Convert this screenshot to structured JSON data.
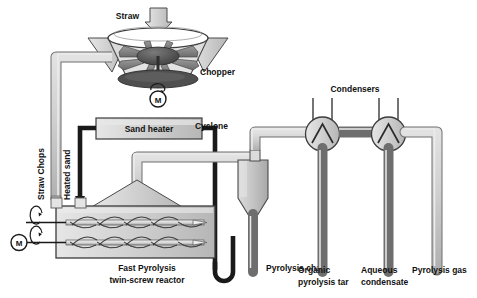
{
  "diagram": {
    "colors": {
      "pipe_fill": "#c9c9c9",
      "pipe_stroke": "#6e6e6e",
      "black_pipe": "#1a1a1a",
      "vessel_fill": "#d2d2d2",
      "vessel_stroke": "#555555",
      "blade_fill": "#8a8a8a",
      "hub_fill": "#555555",
      "background": "#ffffff",
      "text": "#111111"
    },
    "labels": {
      "straw": "Straw",
      "chopper": "Chopper",
      "motor_chopper": "M",
      "straw_chops": "Straw Chops",
      "heated_sand": "Heated sand",
      "sand_heater": "Sand heater",
      "cyclone": "Cyclone",
      "condensers": "Condensers",
      "motor_reactor": "M",
      "reactor_line1": "Fast Pyrolysis",
      "reactor_line2": "twin-screw reactor",
      "pyrolysis_char": "Pyrolysis char",
      "organic_tar_line1": "Organic",
      "organic_tar_line2": "pyrolysis tar",
      "aqueous_line1": "Aqueous",
      "aqueous_line2": "condensate",
      "pyrolysis_gas": "Pyrolysis gas"
    },
    "equipment": [
      {
        "name": "chopper",
        "label": "Chopper",
        "type": "rotary-chopper"
      },
      {
        "name": "sand-heater",
        "label": "Sand heater",
        "type": "box-heater"
      },
      {
        "name": "twin-screw-reactor",
        "label": "Fast Pyrolysis twin-screw reactor",
        "type": "twin-screw"
      },
      {
        "name": "cyclone",
        "label": "Cyclone",
        "type": "cyclone-separator"
      },
      {
        "name": "condenser-1",
        "label": "Condensers",
        "type": "heat-exchanger"
      },
      {
        "name": "condenser-2",
        "label": "Condensers",
        "type": "heat-exchanger"
      }
    ],
    "streams": [
      {
        "name": "straw-feed",
        "label": "Straw"
      },
      {
        "name": "straw-chops",
        "label": "Straw Chops"
      },
      {
        "name": "heated-sand",
        "label": "Heated sand"
      },
      {
        "name": "pyrolysis-char",
        "label": "Pyrolysis char"
      },
      {
        "name": "organic-pyrolysis-tar",
        "label": "Organic pyrolysis tar"
      },
      {
        "name": "aqueous-condensate",
        "label": "Aqueous condensate"
      },
      {
        "name": "pyrolysis-gas",
        "label": "Pyrolysis gas"
      }
    ]
  }
}
